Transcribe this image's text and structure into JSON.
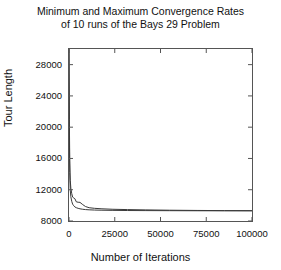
{
  "chart_data": {
    "type": "line",
    "title": "Minimum and Maximum Convergence Rates of 10 runs of the Bays 29 Problem",
    "title_line1": "Minimum and Maximum Convergence Rates",
    "title_line2": "of 10 runs of the Bays 29 Problem",
    "xlabel": "Number of Iterations",
    "ylabel": "Tour Length",
    "xlim": [
      0,
      100000
    ],
    "ylim": [
      8000,
      30000
    ],
    "grid": false,
    "legend": "none",
    "xticks": [
      0,
      25000,
      50000,
      75000,
      100000
    ],
    "xtick_labels": [
      "0",
      "25000",
      "50000",
      "75000",
      "100000"
    ],
    "yticks": [
      8000,
      12000,
      16000,
      20000,
      24000,
      28000
    ],
    "ytick_labels": [
      "8000",
      "12000",
      "16000",
      "20000",
      "24000",
      "28000"
    ],
    "line_color": "#3a3a3a",
    "series": [
      {
        "name": "Maximum",
        "x": [
          0,
          200,
          400,
          700,
          1000,
          1500,
          2000,
          2600,
          3200,
          4000,
          5000,
          6000,
          7500,
          9000,
          11000,
          14000,
          18000,
          24000,
          32000,
          42000,
          55000,
          70000,
          85000,
          100000
        ],
        "values": [
          30000,
          21000,
          15800,
          13200,
          12200,
          11500,
          11050,
          10950,
          10850,
          10450,
          10400,
          10380,
          10100,
          9850,
          9700,
          9620,
          9560,
          9500,
          9460,
          9420,
          9380,
          9350,
          9330,
          9320
        ]
      },
      {
        "name": "Minimum",
        "x": [
          0,
          200,
          400,
          700,
          1000,
          1500,
          2000,
          2600,
          3200,
          4000,
          5000,
          6000,
          7500,
          9000,
          11000,
          14000,
          18000,
          24000,
          32000,
          42000,
          55000,
          70000,
          85000,
          100000
        ],
        "values": [
          30000,
          19500,
          14200,
          11900,
          11100,
          10500,
          10150,
          9950,
          9800,
          9700,
          9620,
          9560,
          9500,
          9460,
          9430,
          9400,
          9380,
          9360,
          9340,
          9330,
          9320,
          9310,
          9305,
          9300
        ]
      }
    ]
  }
}
